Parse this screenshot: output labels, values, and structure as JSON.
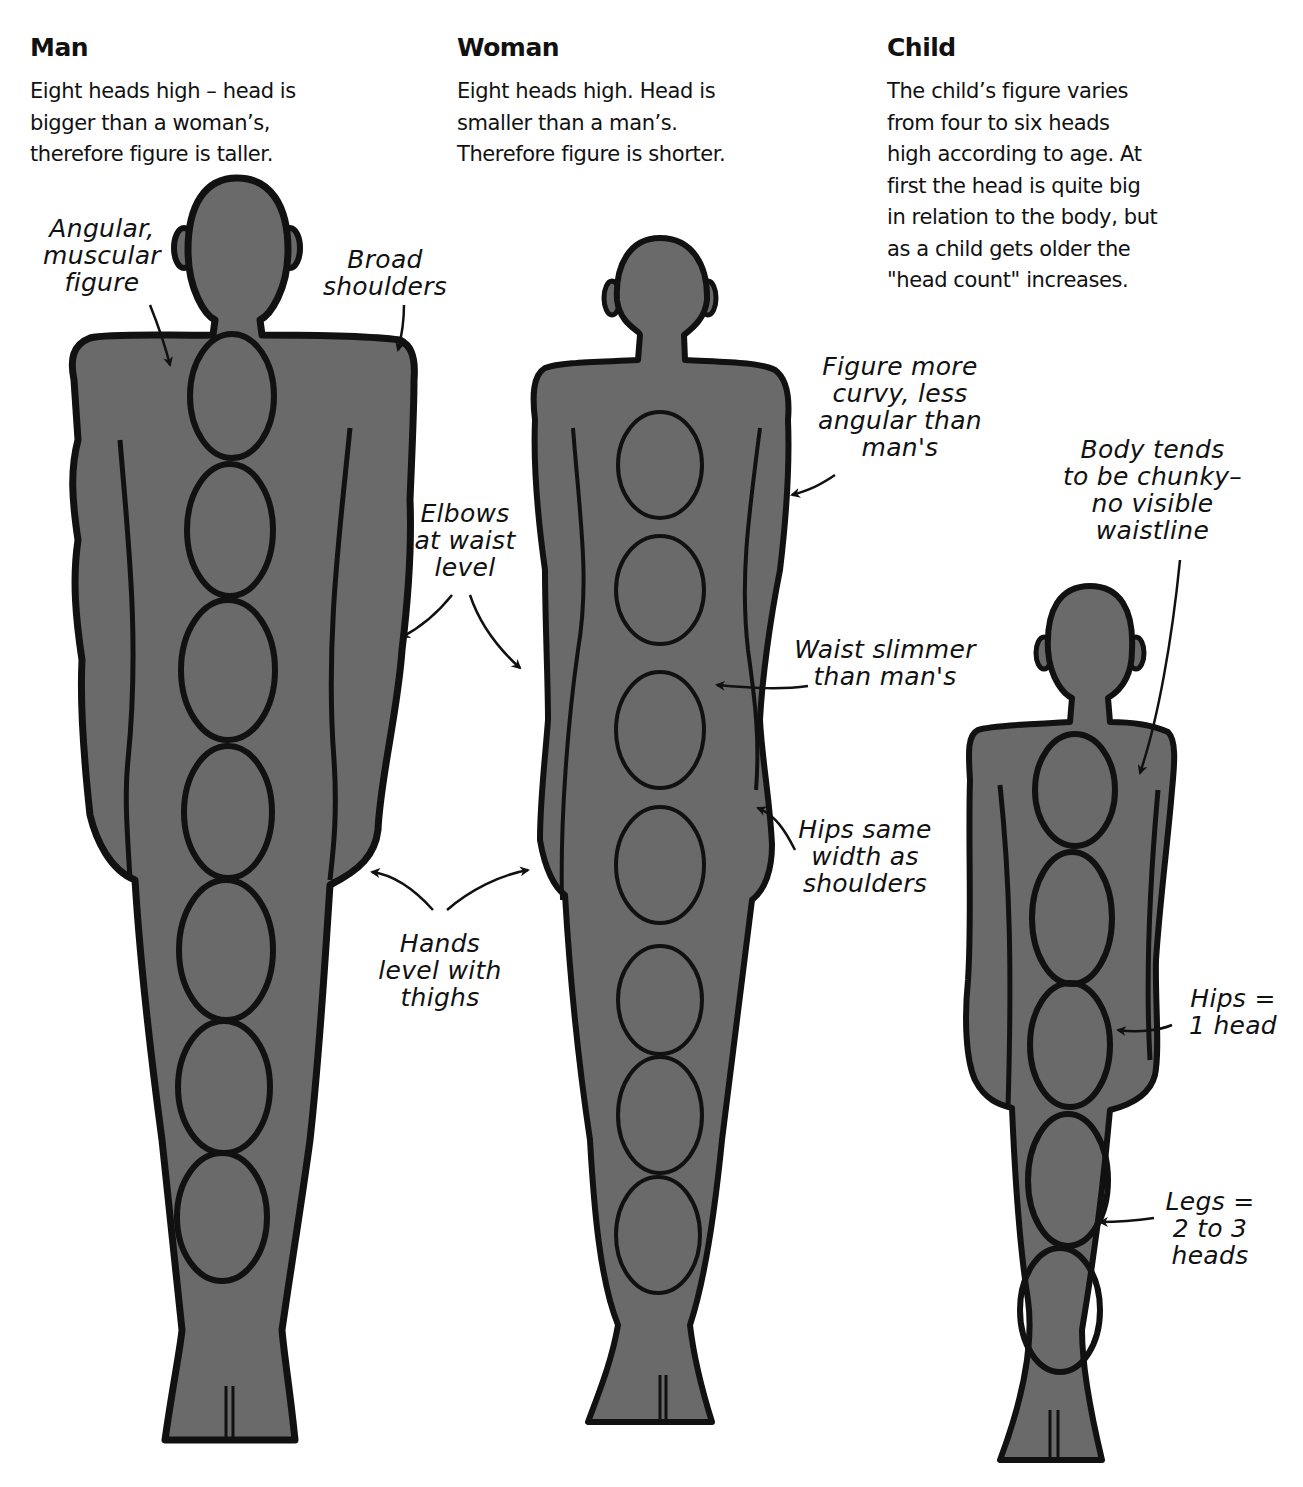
{
  "columns": {
    "man": {
      "title": "Man",
      "description": "Eight heads high – head is\nbigger than a woman’s,\ntherefore figure is taller.",
      "head_count": 8
    },
    "woman": {
      "title": "Woman",
      "description": "Eight heads high. Head is\nsmaller than a man’s.\nTherefore figure is shorter.",
      "head_count": 8
    },
    "child": {
      "title": "Child",
      "description": "The child’s figure varies\nfrom four to six heads\nhigh according to age. At\nfirst the head is quite big\nin relation to the body, but\nas a child gets older the\n\"head count\" increases.",
      "head_count": 6
    }
  },
  "annotations": {
    "angular": "Angular,\nmuscular\nfigure",
    "broad_shoulders": "Broad\nshoulders",
    "elbows": "Elbows\nat waist\nlevel",
    "hands": "Hands\nlevel with\nthighs",
    "curvy": "Figure more\ncurvy, less\nangular than\nman's",
    "waist": "Waist slimmer\nthan man's",
    "hips_same": "Hips same\nwidth as\nshoulders",
    "chunky": "Body tends\nto be chunky–\nno visible\nwaistline",
    "hips_child": "Hips =\n1 head",
    "legs_child": "Legs =\n2 to 3\nheads"
  },
  "colors": {
    "figure_fill": "#6a6a6a",
    "outline": "#111111",
    "background": "#ffffff"
  }
}
